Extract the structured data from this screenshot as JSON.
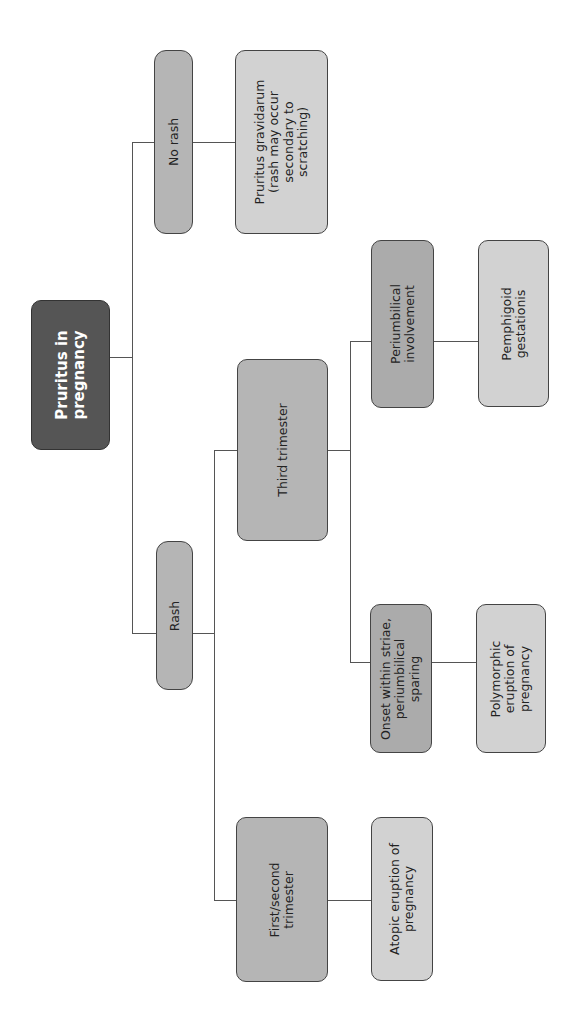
{
  "diagram": {
    "title": "Pruritus in pregnancy",
    "orientation": "rotated-90-ccw",
    "nodes": {
      "root": {
        "label": "Pruritus in pregnancy",
        "lines": [
          "Pruritus in",
          "pregnancy"
        ]
      },
      "no_rash": {
        "label": "No rash",
        "lines": [
          "No rash"
        ]
      },
      "pruritus_gravidarum": {
        "label": "Pruritus gravidarum (rash may occur secondary to scratching)",
        "lines": [
          "Pruritus gravidarum",
          "(rash may occur",
          "secondary to",
          "scratching)"
        ]
      },
      "rash": {
        "label": "Rash",
        "lines": [
          "Rash"
        ]
      },
      "third_trimester": {
        "label": "Third trimester",
        "lines": [
          "Third trimester"
        ]
      },
      "periumbilical": {
        "label": "Periumbilical involvement",
        "lines": [
          "Periumbilical",
          "involvement"
        ]
      },
      "pemphigoid": {
        "label": "Pemphigoid gestationis",
        "lines": [
          "Pemphigoid",
          "gestationis"
        ]
      },
      "onset_striae": {
        "label": "Onset within striae, periumbilical sparing",
        "lines": [
          "Onset within striae,",
          "periumbilical",
          "sparing"
        ]
      },
      "polymorphic": {
        "label": "Polymorphic eruption of pregnancy",
        "lines": [
          "Polymorphic",
          "eruption of",
          "pregnancy"
        ]
      },
      "first_second": {
        "label": "First/second trimester",
        "lines": [
          "First/second",
          "trimester"
        ]
      },
      "atopic": {
        "label": "Atopic eruption of pregnancy",
        "lines": [
          "Atopic eruption of",
          "pregnancy"
        ]
      }
    },
    "edges": [
      [
        "root",
        "no_rash"
      ],
      [
        "root",
        "rash"
      ],
      [
        "no_rash",
        "pruritus_gravidarum"
      ],
      [
        "rash",
        "third_trimester"
      ],
      [
        "rash",
        "first_second"
      ],
      [
        "third_trimester",
        "periumbilical"
      ],
      [
        "third_trimester",
        "onset_striae"
      ],
      [
        "periumbilical",
        "pemphigoid"
      ],
      [
        "onset_striae",
        "polymorphic"
      ],
      [
        "first_second",
        "atopic"
      ]
    ],
    "colors": {
      "root": "#555555",
      "branch": "#b5b5b5",
      "leaf": "#d2d2d2",
      "line": "#555555"
    }
  }
}
